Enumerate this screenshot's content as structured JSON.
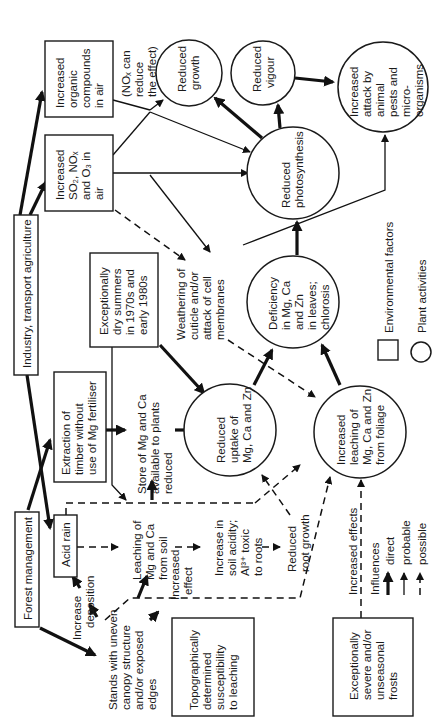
{
  "diagram": {
    "orientation": "rotated 90 degrees counter-clockwise",
    "environmental_factors": {
      "forest_management": "Forest management",
      "industry": "Industry, transport agriculture",
      "acid_rain": "Acid rain",
      "extraction": [
        "Extraction of",
        "timber without",
        "use of Mg fertiliser"
      ],
      "organic": [
        "Increased",
        "organic",
        "compounds",
        "in air"
      ],
      "so2": [
        "Increased",
        "SO₂, NOₓ",
        "and O₃ in",
        "air"
      ],
      "dry_summers": [
        "Exceptionally",
        "dry summers",
        "in 1970s and",
        "early 1980s"
      ],
      "topographic": [
        "Topographically",
        "determined",
        "susceptibility",
        "to leaching"
      ],
      "frosts": [
        "Exceptionally",
        "severe and/or",
        "unseasonal",
        "frosts"
      ]
    },
    "plant_activities": {
      "reduced_growth": [
        "Reduced",
        "growth"
      ],
      "reduced_vigour": [
        "Reduced",
        "vigour"
      ],
      "increased_attack": [
        "Increased",
        "attack by",
        "animal",
        "pests and",
        "micro-",
        "organisms"
      ],
      "reduced_photosynthesis": [
        "Reduced",
        "photosynthesis"
      ],
      "deficiency": [
        "Deficiency",
        "in Mg, Ca",
        "and Zn",
        "in leaves;",
        "chlorosis"
      ],
      "reduced_uptake": [
        "Reduced",
        "uptake of",
        "Mg, Ca and Zn"
      ],
      "increased_leaching": [
        "Increased",
        "leaching of",
        "Mg, Ca and Zn",
        "from foliage"
      ]
    },
    "intermediate_labels": {
      "nox_note": [
        "(NOₓ can",
        "reduce",
        "the effect)"
      ],
      "weathering": [
        "Weathering of",
        "cuticle and/or",
        "attack of cell",
        "membranes"
      ],
      "store": [
        "Store of Mg and Ca",
        "available to plants",
        "reduced"
      ],
      "leaching_soil": [
        "Leaching of",
        "Mg and Ca",
        "from soil"
      ],
      "soil_acidity": [
        "Increase in",
        "soil acidity;",
        "Al³⁺ toxic",
        "to roots"
      ],
      "root_growth": [
        "Reduced",
        "root growth"
      ],
      "stands": [
        "Stands with uneven",
        "canopy structure",
        "and/or exposed",
        "edges"
      ],
      "increase_deposition": [
        "Increase",
        "deposition"
      ],
      "increased_effect": [
        "Increased",
        "effect"
      ],
      "increased_effects": "Increased effects"
    },
    "legend": {
      "box_label": "Environmental factors",
      "circle_label": "Plant activities",
      "influences_title": "Influences",
      "direct": "direct",
      "probable": "probable",
      "possible": "possible"
    }
  }
}
